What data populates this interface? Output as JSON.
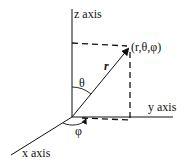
{
  "diagram": {
    "labels": {
      "z_axis": "z axis",
      "y_axis": "y axis",
      "x_axis": "x axis",
      "point": "(r,θ,φ)",
      "radius": "r",
      "theta": "θ",
      "phi": "φ"
    },
    "colors": {
      "line": "#111111",
      "background": "#ffffff"
    }
  }
}
